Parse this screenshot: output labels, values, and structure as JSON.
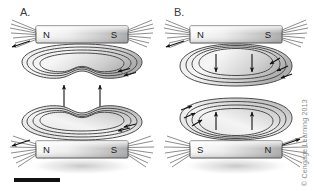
{
  "figure": {
    "background_color": "#ffffff",
    "scale_bar": {
      "name": "scale-bar",
      "color": "#111111",
      "x": 14,
      "y": 178,
      "width": 46,
      "height": 4
    },
    "credit": {
      "text": "© Cengage Learning 2013",
      "color": "#8a8a8a",
      "orientation": "vertical"
    },
    "panels": [
      {
        "id": "A",
        "label": "A.",
        "interaction": "attraction",
        "magnets": [
          {
            "id": "a-top",
            "left_pole": "N",
            "right_pole": "S",
            "x": 36,
            "y": 26,
            "width": 92,
            "height": 17
          },
          {
            "id": "a-bottom",
            "left_pole": "N",
            "right_pole": "S",
            "x": 36,
            "y": 141,
            "width": 92,
            "height": 17
          }
        ],
        "force_arrows": {
          "style": "double-headed",
          "count": 2,
          "direction": "both",
          "meaning": "attraction"
        }
      },
      {
        "id": "B",
        "label": "B.",
        "interaction": "repulsion",
        "magnets": [
          {
            "id": "b-top",
            "left_pole": "N",
            "right_pole": "S",
            "x": 190,
            "y": 26,
            "width": 92,
            "height": 17
          },
          {
            "id": "b-bottom",
            "left_pole": "S",
            "right_pole": "N",
            "x": 190,
            "y": 141,
            "width": 92,
            "height": 17
          }
        ],
        "force_arrows": {
          "style": "single-headed",
          "count": 4,
          "direction": "away-from-gap",
          "meaning": "repulsion"
        }
      }
    ],
    "colors": {
      "field_line": "#4a4a4a",
      "field_band_light": "#f0f0f0",
      "field_band_dark": "#b8b8b8",
      "magnet_light": "#f4f4f4",
      "magnet_dark": "#9a9a9a",
      "arrow": "#111111",
      "label": "#3b3b3b"
    }
  }
}
